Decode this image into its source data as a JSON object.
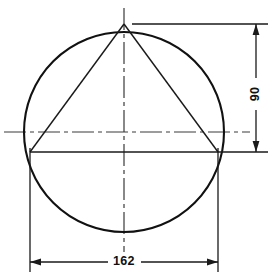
{
  "drawing": {
    "title": "Triangle inscribed in circle with dimensions",
    "style": {
      "background": "#ffffff",
      "line_color": "#111111",
      "centerline_color": "#3a3a3a",
      "text_color": "#111111"
    },
    "geometry": {
      "circle": {
        "center_x": 124,
        "center_y": 132,
        "radius": 100,
        "left_x": 24,
        "right_x": 224,
        "top_y": 32,
        "bottom_y": 232
      },
      "triangle": {
        "apex_x": 124,
        "apex_y": 24,
        "base_y": 152,
        "base_left_x": 30,
        "base_right_x": 218
      },
      "centerline_horizontal_y": 132,
      "centerline_vertical_x": 124
    },
    "dimensions": [
      {
        "name": "height-dimension",
        "label": "90",
        "orientation": "vertical",
        "line_x": 256,
        "from_y": 24,
        "to_y": 152,
        "label_x": 256,
        "label_y": 94
      },
      {
        "name": "width-dimension",
        "label": "162",
        "orientation": "horizontal",
        "line_y": 262,
        "from_x": 30,
        "to_x": 218,
        "label_x": 124,
        "label_y": 266
      }
    ]
  }
}
